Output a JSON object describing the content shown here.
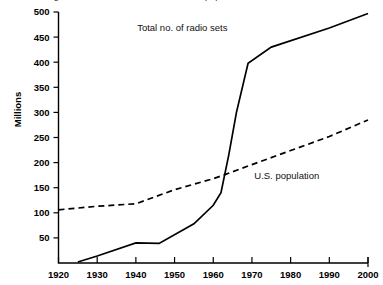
{
  "chart_data": {
    "type": "line",
    "title": "Figure 1. Growth of radio sets vs. U.S. population",
    "title_note": "cut off at top edge of screenshot",
    "xlabel": "",
    "ylabel": "Millions",
    "xlim": [
      1920,
      2000
    ],
    "ylim": [
      0,
      500
    ],
    "grid": false,
    "legend": "inline annotations",
    "xticks": [
      "1920",
      "1930",
      "1940",
      "1950",
      "1960",
      "1970",
      "1980",
      "1990",
      "2000"
    ],
    "yticks": [
      "50",
      "100",
      "150",
      "200",
      "250",
      "300",
      "350",
      "400",
      "450",
      "500"
    ],
    "annotations": [
      {
        "text": "Total no. of radio sets",
        "x": 1952,
        "y": 462
      },
      {
        "text": "U.S. population",
        "x": 1979,
        "y": 168
      }
    ],
    "series": [
      {
        "name": "Total no. of radio sets",
        "style": "solid",
        "points": [
          {
            "x": 1925,
            "y": 2
          },
          {
            "x": 1930,
            "y": 14
          },
          {
            "x": 1940,
            "y": 40
          },
          {
            "x": 1946,
            "y": 39
          },
          {
            "x": 1955,
            "y": 78
          },
          {
            "x": 1960,
            "y": 115
          },
          {
            "x": 1962,
            "y": 140
          },
          {
            "x": 1964,
            "y": 215
          },
          {
            "x": 1966,
            "y": 300
          },
          {
            "x": 1969,
            "y": 398
          },
          {
            "x": 1975,
            "y": 430
          },
          {
            "x": 1990,
            "y": 468
          },
          {
            "x": 2000,
            "y": 497
          }
        ]
      },
      {
        "name": "U.S. population",
        "style": "dashed",
        "points": [
          {
            "x": 1920,
            "y": 106
          },
          {
            "x": 1930,
            "y": 113
          },
          {
            "x": 1940,
            "y": 118
          },
          {
            "x": 1950,
            "y": 146
          },
          {
            "x": 1960,
            "y": 168
          },
          {
            "x": 1963,
            "y": 176
          },
          {
            "x": 1970,
            "y": 196
          },
          {
            "x": 1980,
            "y": 224
          },
          {
            "x": 1990,
            "y": 252
          },
          {
            "x": 2000,
            "y": 285
          }
        ]
      }
    ]
  }
}
